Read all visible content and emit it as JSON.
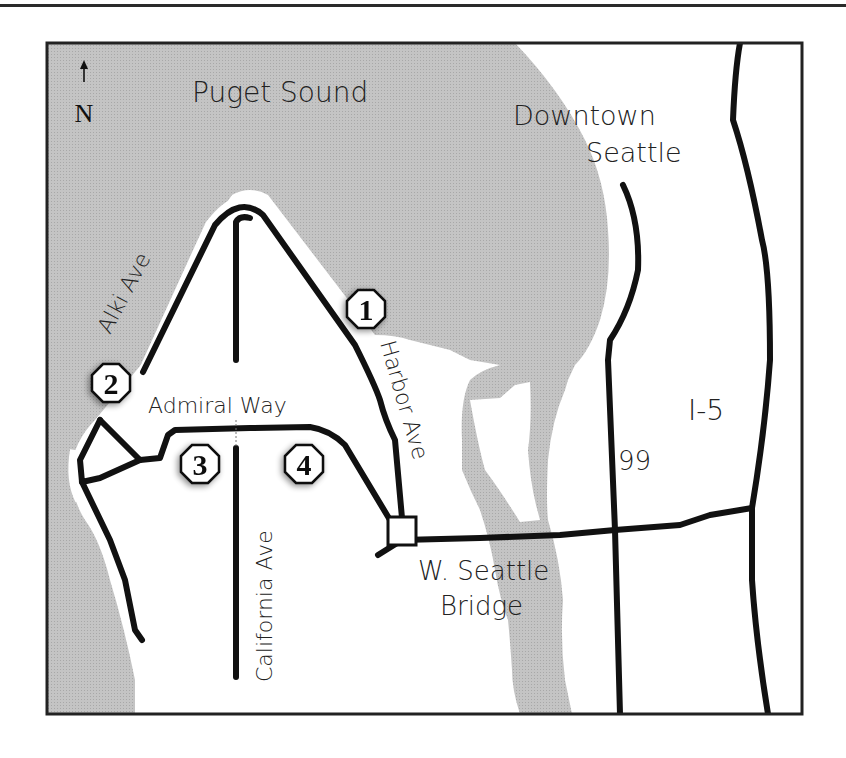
{
  "map": {
    "compass": {
      "arrow": "↑",
      "label": "N"
    },
    "water_labels": {
      "puget_sound": "Puget Sound"
    },
    "place_labels": {
      "downtown_line1": "Downtown",
      "downtown_line2": "Seattle"
    },
    "road_labels": {
      "alki": "Alki Ave",
      "admiral": "Admiral Way",
      "california": "California Ave",
      "harbor": "Harbor Ave",
      "bridge_line1": "W. Seattle",
      "bridge_line2": "Bridge",
      "route99": "99",
      "i5": "I-5"
    },
    "markers": [
      {
        "id": "1",
        "label": "1"
      },
      {
        "id": "2",
        "label": "2"
      },
      {
        "id": "3",
        "label": "3"
      },
      {
        "id": "4",
        "label": "4"
      }
    ],
    "colors": {
      "water": "#c2c2c2",
      "land": "#ffffff",
      "road": "#111111",
      "frame": "#222222"
    }
  }
}
